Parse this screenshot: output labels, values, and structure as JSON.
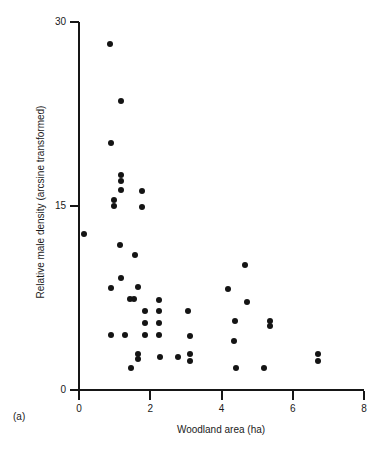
{
  "panel": {
    "label": "(a)"
  },
  "chart_data": {
    "type": "scatter",
    "title": "",
    "xlabel": "Woodland area (ha)",
    "ylabel": "Relative male density (arcsine transformed)",
    "xlim": [
      0,
      8
    ],
    "ylim": [
      0,
      30
    ],
    "xticks": [
      0,
      2,
      4,
      6,
      8
    ],
    "xtick_labels": [
      "0",
      "2",
      "4",
      "6",
      "8"
    ],
    "yticks": [
      0,
      15,
      30
    ],
    "ytick_labels": [
      "0",
      "15",
      "30"
    ],
    "grid": false,
    "legend": null,
    "marker": "filled-circle",
    "marker_color": "#141414",
    "points": [
      {
        "x": 0.86,
        "y": 28.2
      },
      {
        "x": 1.17,
        "y": 23.6
      },
      {
        "x": 0.89,
        "y": 20.1
      },
      {
        "x": 1.19,
        "y": 17.5
      },
      {
        "x": 1.19,
        "y": 17.0
      },
      {
        "x": 1.19,
        "y": 16.3
      },
      {
        "x": 1.78,
        "y": 16.2
      },
      {
        "x": 0.97,
        "y": 15.5
      },
      {
        "x": 0.97,
        "y": 15.0
      },
      {
        "x": 1.78,
        "y": 14.9
      },
      {
        "x": 0.14,
        "y": 12.7
      },
      {
        "x": 1.14,
        "y": 11.8
      },
      {
        "x": 1.58,
        "y": 11.0
      },
      {
        "x": 4.67,
        "y": 10.2
      },
      {
        "x": 1.19,
        "y": 9.1
      },
      {
        "x": 0.89,
        "y": 8.3
      },
      {
        "x": 1.67,
        "y": 8.4
      },
      {
        "x": 4.19,
        "y": 8.2
      },
      {
        "x": 1.42,
        "y": 7.4
      },
      {
        "x": 1.53,
        "y": 7.4
      },
      {
        "x": 2.25,
        "y": 7.3
      },
      {
        "x": 4.72,
        "y": 7.2
      },
      {
        "x": 1.86,
        "y": 6.4
      },
      {
        "x": 2.25,
        "y": 6.4
      },
      {
        "x": 3.06,
        "y": 6.4
      },
      {
        "x": 1.86,
        "y": 5.5
      },
      {
        "x": 2.25,
        "y": 5.5
      },
      {
        "x": 4.39,
        "y": 5.6
      },
      {
        "x": 5.36,
        "y": 5.6
      },
      {
        "x": 5.36,
        "y": 5.2
      },
      {
        "x": 0.89,
        "y": 4.5
      },
      {
        "x": 1.28,
        "y": 4.5
      },
      {
        "x": 1.86,
        "y": 4.5
      },
      {
        "x": 2.25,
        "y": 4.5
      },
      {
        "x": 3.11,
        "y": 4.4
      },
      {
        "x": 4.36,
        "y": 4.0
      },
      {
        "x": 1.67,
        "y": 2.9
      },
      {
        "x": 1.67,
        "y": 2.5
      },
      {
        "x": 2.28,
        "y": 2.7
      },
      {
        "x": 2.78,
        "y": 2.7
      },
      {
        "x": 3.11,
        "y": 2.9
      },
      {
        "x": 3.11,
        "y": 2.4
      },
      {
        "x": 6.72,
        "y": 2.9
      },
      {
        "x": 6.72,
        "y": 2.4
      },
      {
        "x": 1.47,
        "y": 1.8
      },
      {
        "x": 4.42,
        "y": 1.8
      },
      {
        "x": 5.19,
        "y": 1.8
      }
    ]
  }
}
